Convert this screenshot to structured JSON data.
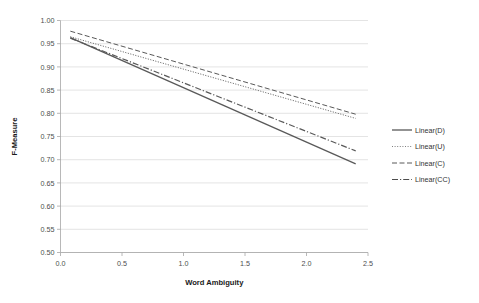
{
  "chart_data": {
    "type": "line",
    "title": "",
    "subtitle": "",
    "xlabel": "Word Ambiguity",
    "ylabel": "F-Measure",
    "xlim": [
      0.0,
      2.5
    ],
    "ylim": [
      0.5,
      1.0
    ],
    "xticks": [
      "0.0",
      "0.5",
      "1.0",
      "1.5",
      "2.0",
      "2.5"
    ],
    "xtick_values": [
      0.0,
      0.5,
      1.0,
      1.5,
      2.0,
      2.5
    ],
    "yticks": [
      "0.50",
      "0.55",
      "0.60",
      "0.65",
      "0.70",
      "0.75",
      "0.80",
      "0.85",
      "0.90",
      "0.95",
      "1.00"
    ],
    "ytick_values": [
      0.5,
      0.55,
      0.6,
      0.65,
      0.7,
      0.75,
      0.8,
      0.85,
      0.9,
      0.95,
      1.0
    ],
    "grid": "horizontal",
    "legend_position": "right",
    "series": [
      {
        "name": "Linear(D)",
        "style": "solid",
        "color": "#595959",
        "x": [
          0.08,
          2.4
        ],
        "values": [
          0.963,
          0.691
        ]
      },
      {
        "name": "Linear(U)",
        "style": "dotted",
        "color": "#7f7f7f",
        "x": [
          0.08,
          2.4
        ],
        "values": [
          0.965,
          0.789
        ]
      },
      {
        "name": "Linear(C)",
        "style": "dashed",
        "color": "#595959",
        "x": [
          0.08,
          2.4
        ],
        "values": [
          0.977,
          0.798
        ]
      },
      {
        "name": "Linear(CC)",
        "style": "dashdot",
        "color": "#4d4d4d",
        "x": [
          0.08,
          2.4
        ],
        "values": [
          0.962,
          0.719
        ]
      }
    ]
  },
  "legend": {
    "items": [
      {
        "label": "Linear(D)"
      },
      {
        "label": "Linear(U)"
      },
      {
        "label": "Linear(C)"
      },
      {
        "label": "Linear(CC)"
      }
    ]
  }
}
